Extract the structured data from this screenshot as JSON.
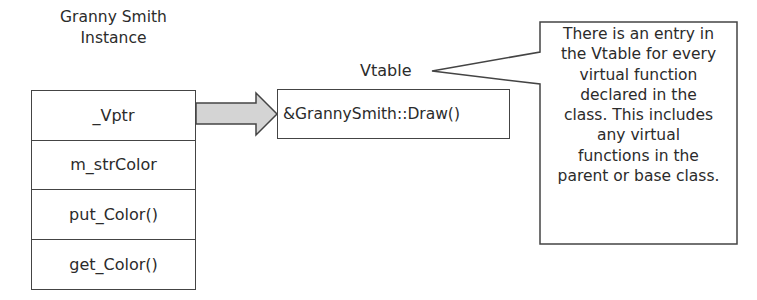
{
  "instance": {
    "title_line1": "Granny Smith",
    "title_line2": "Instance",
    "rows": [
      {
        "label": "_Vptr"
      },
      {
        "label": "m_strColor"
      },
      {
        "label": "put_Color()"
      },
      {
        "label": "get_Color()"
      }
    ]
  },
  "arrow": {
    "icon": "block-arrow-right-icon",
    "fill_color": "#d4d4d4"
  },
  "vtable": {
    "label": "Vtable",
    "entries": [
      {
        "label": "&GrannySmith::Draw()"
      }
    ]
  },
  "callout": {
    "lines": [
      "There is an entry in",
      "the Vtable for every",
      "virtual function",
      "declared in the",
      "class. This includes",
      "any virtual",
      "functions in the",
      "parent or base class."
    ]
  },
  "colors": {
    "stroke": "#444444",
    "text": "#2b2b2b",
    "background": "#ffffff"
  }
}
